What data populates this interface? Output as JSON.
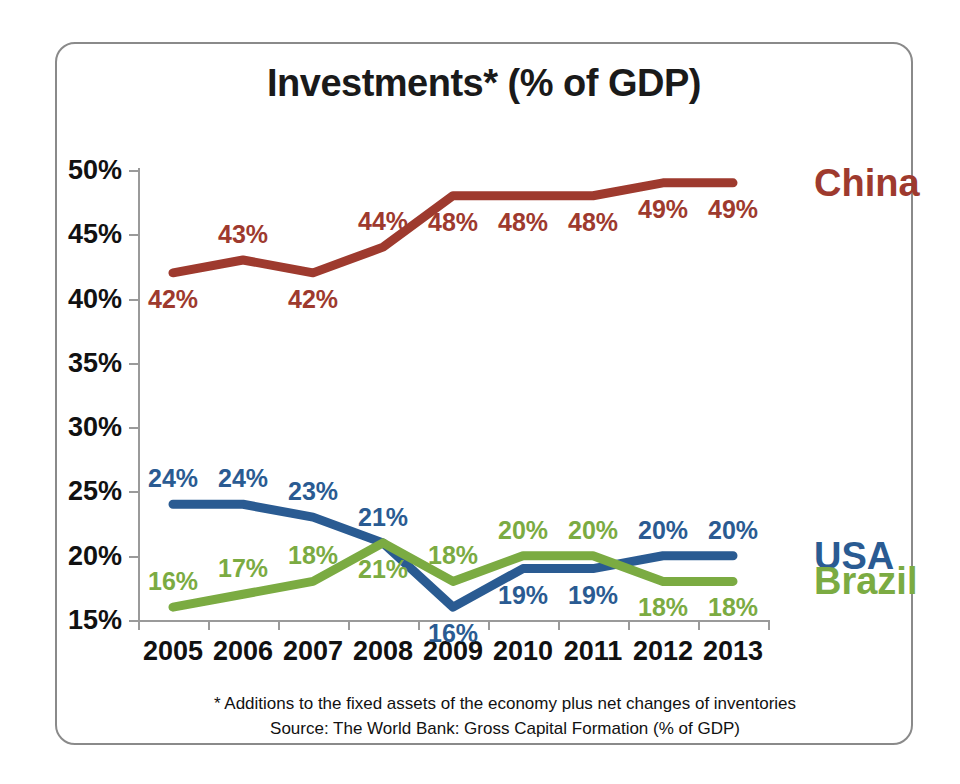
{
  "chart_data": {
    "type": "line",
    "title": "Investments* (% of GDP)",
    "xlabel": "",
    "ylabel": "",
    "categories": [
      "2005",
      "2006",
      "2007",
      "2008",
      "2009",
      "2010",
      "2011",
      "2012",
      "2013"
    ],
    "ylim": [
      15,
      50
    ],
    "ytick_values": [
      15,
      20,
      25,
      30,
      35,
      40,
      45,
      50
    ],
    "ytick_labels": [
      "15%",
      "20%",
      "25%",
      "30%",
      "35%",
      "40%",
      "45%",
      "50%"
    ],
    "grid": false,
    "legend_position": "right-inline-series-labels",
    "series": [
      {
        "name": "China",
        "color": "#9E3A2E",
        "values": [
          42,
          43,
          42,
          44,
          48,
          48,
          48,
          49,
          49
        ],
        "data_labels": [
          "42%",
          "43%",
          "42%",
          "44%",
          "48%",
          "48%",
          "48%",
          "49%",
          "49%"
        ],
        "label_side": [
          "below",
          "above",
          "below",
          "above",
          "below",
          "below",
          "below",
          "below",
          "below"
        ]
      },
      {
        "name": "USA",
        "color": "#2A5B92",
        "values": [
          24,
          24,
          23,
          21,
          16,
          19,
          19,
          20,
          20
        ],
        "data_labels": [
          "24%",
          "24%",
          "23%",
          "21%",
          "16%",
          "19%",
          "19%",
          "20%",
          "20%"
        ],
        "label_side": [
          "above",
          "above",
          "above",
          "above",
          "below",
          "below",
          "below",
          "above",
          "above"
        ]
      },
      {
        "name": "Brazil",
        "color": "#7BAB42",
        "values": [
          16,
          17,
          18,
          21,
          18,
          20,
          20,
          18,
          18
        ],
        "data_labels": [
          "16%",
          "17%",
          "18%",
          "21%",
          "18%",
          "20%",
          "20%",
          "18%",
          "18%"
        ],
        "label_side": [
          "above",
          "above",
          "above",
          "below",
          "above",
          "above",
          "above",
          "below",
          "below"
        ]
      }
    ],
    "annotations": [
      "* Additions to the fixed assets of the economy plus net changes of inventories",
      "Source: The World Bank: Gross Capital Formation (% of GDP)"
    ]
  },
  "footnote": {
    "line1": "* Additions to the fixed assets of the economy plus net changes of inventories",
    "line2": "Source: The World Bank: Gross Capital Formation (% of GDP)"
  },
  "colors": {
    "china": "#9E3A2E",
    "usa": "#2A5B92",
    "brazil": "#7BAB42",
    "axis": "#9A9A9A",
    "frame": "#8A8A8A",
    "text": "#111111",
    "background": "#FFFFFF"
  }
}
